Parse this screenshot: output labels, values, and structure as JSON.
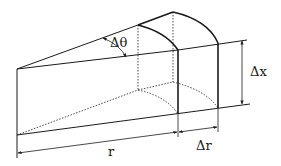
{
  "diagram": {
    "type": "geometry-sketch",
    "colors": {
      "stroke": "#1a1a1a",
      "background": "#ffffff"
    },
    "labels": {
      "delta_theta": "Δθ",
      "delta_x": "Δx",
      "r": "r",
      "delta_r": "Δr"
    }
  }
}
